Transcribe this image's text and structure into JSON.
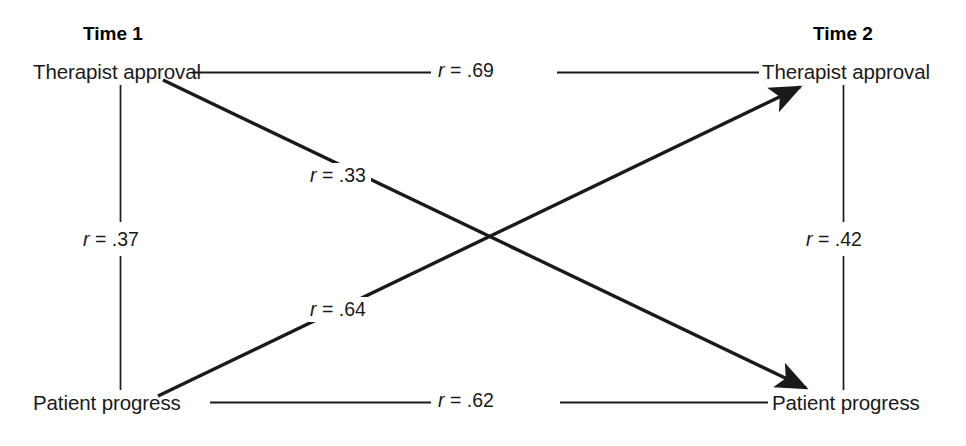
{
  "diagram": {
    "type": "cross-lagged-panel-correlation",
    "waves": [
      {
        "id": "time1",
        "label": "Time 1"
      },
      {
        "id": "time2",
        "label": "Time 2"
      }
    ],
    "nodes": [
      {
        "id": "t1-therapist-approval",
        "label": "Therapist approval",
        "wave": "Time 1",
        "position": "top-left"
      },
      {
        "id": "t2-therapist-approval",
        "label": "Therapist approval",
        "wave": "Time 2",
        "position": "top-right"
      },
      {
        "id": "t1-patient-progress",
        "label": "Patient progress",
        "wave": "Time 1",
        "position": "bottom-left"
      },
      {
        "id": "t2-patient-progress",
        "label": "Patient progress",
        "wave": "Time 2",
        "position": "bottom-right"
      }
    ],
    "paths": [
      {
        "id": "stability-therapist-approval",
        "from": "t1-therapist-approval",
        "to": "t2-therapist-approval",
        "kind": "horizontal-top",
        "arrow": false,
        "r_symbol": "r",
        "equals": " = ",
        "value": ".69",
        "label": "r = .69"
      },
      {
        "id": "stability-patient-progress",
        "from": "t1-patient-progress",
        "to": "t2-patient-progress",
        "kind": "horizontal-bottom",
        "arrow": false,
        "r_symbol": "r",
        "equals": " = ",
        "value": ".62",
        "label": "r = .62"
      },
      {
        "id": "synchronous-time1",
        "from": "t1-therapist-approval",
        "to": "t1-patient-progress",
        "kind": "vertical-left",
        "arrow": false,
        "r_symbol": "r",
        "equals": " = ",
        "value": ".37",
        "label": "r = .37"
      },
      {
        "id": "synchronous-time2",
        "from": "t2-therapist-approval",
        "to": "t2-patient-progress",
        "kind": "vertical-right",
        "arrow": false,
        "r_symbol": "r",
        "equals": " = ",
        "value": ".42",
        "label": "r = .42"
      },
      {
        "id": "crosslag-approval-to-progress",
        "from": "t1-therapist-approval",
        "to": "t2-patient-progress",
        "kind": "diagonal-descending",
        "arrow": true,
        "r_symbol": "r",
        "equals": " = ",
        "value": ".33",
        "label": "r = .33"
      },
      {
        "id": "crosslag-progress-to-approval",
        "from": "t1-patient-progress",
        "to": "t2-therapist-approval",
        "kind": "diagonal-ascending",
        "arrow": true,
        "r_symbol": "r",
        "equals": " = ",
        "value": ".64",
        "label": "r = .64"
      }
    ],
    "colors": {
      "line": "#1a1a1a",
      "text": "#1a1a1a",
      "background": "#ffffff"
    }
  }
}
